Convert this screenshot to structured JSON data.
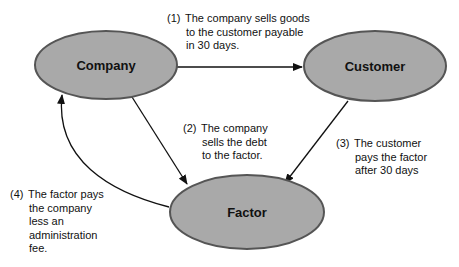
{
  "colors": {
    "node_fill": "#a9a9a9",
    "node_stroke": "#555555",
    "arrow": "#111111",
    "text": "#111111",
    "background": "#ffffff"
  },
  "nodes": {
    "company": {
      "label": "Company"
    },
    "customer": {
      "label": "Customer"
    },
    "factor": {
      "label": "Factor"
    }
  },
  "steps": [
    {
      "number": "(1)",
      "lines": [
        "The company sells goods",
        "to the customer payable",
        "in 30 days."
      ],
      "from": "Company",
      "to": "Customer"
    },
    {
      "number": "(2)",
      "lines": [
        "The company",
        "sells the debt",
        "to the factor."
      ],
      "from": "Company",
      "to": "Factor"
    },
    {
      "number": "(3)",
      "lines": [
        "The customer",
        "pays the factor",
        "after 30 days"
      ],
      "from": "Customer",
      "to": "Factor"
    },
    {
      "number": "(4)",
      "lines": [
        "The factor pays",
        "the company",
        "less an",
        "administration",
        "fee."
      ],
      "from": "Factor",
      "to": "Company"
    }
  ]
}
